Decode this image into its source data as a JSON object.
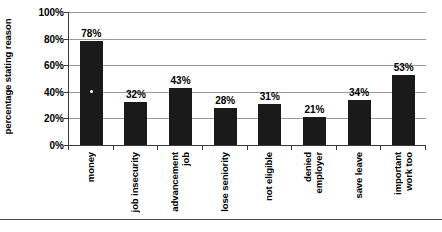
{
  "chart_data": {
    "type": "bar",
    "title": "",
    "subtitle": "",
    "xlabel": "",
    "ylabel": "percentage stating reason",
    "ylim": [
      0,
      100
    ],
    "ytick_values": [
      0,
      20,
      40,
      60,
      80,
      100
    ],
    "ytick_labels": [
      "0%",
      "20%",
      "40%",
      "60%",
      "80%",
      "100%"
    ],
    "grid": true,
    "legend": false,
    "legend_position": "none",
    "orientation": "vertical",
    "bar_color": "#1a1a1a",
    "categories": [
      "money",
      "job insecurity",
      "job advancement",
      "lose seniority",
      "not eligible",
      "employer denied",
      "save leave",
      "work too important"
    ],
    "category_label_lines": [
      [
        "money"
      ],
      [
        "job insecurity"
      ],
      [
        "advancement",
        "job"
      ],
      [
        "lose seniority"
      ],
      [
        "not eligible"
      ],
      [
        "denied",
        "employer"
      ],
      [
        "save leave"
      ],
      [
        "important",
        "work too"
      ]
    ],
    "values": [
      78,
      32,
      43,
      28,
      31,
      21,
      34,
      53
    ],
    "value_labels": [
      "78%",
      "32%",
      "43%",
      "28%",
      "31%",
      "21%",
      "34%",
      "53%"
    ]
  },
  "colors": {
    "bar": "#1a1a1a",
    "axis": "#3a3a3a",
    "gridline": "#9a9a9a",
    "text": "#000000",
    "background": "#ffffff"
  }
}
